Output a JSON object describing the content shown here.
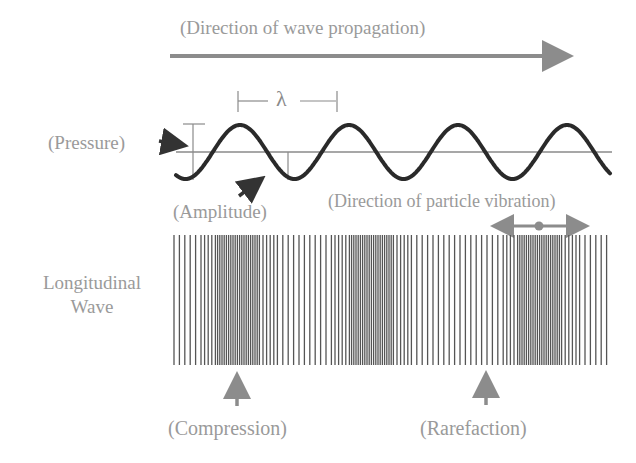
{
  "diagram": {
    "title": "(Direction of wave propagation)",
    "labels": {
      "pressure": "(Pressure)",
      "amplitude": "(Amplitude)",
      "wavelength_symbol": "λ",
      "particle_vibration": "(Direction of particle vibration)",
      "longitudinal_wave": "Longitudinal Wave",
      "compression": "(Compression)",
      "rarefaction": "(Rarefaction)"
    },
    "colors": {
      "text": "#9a9a9a",
      "wave": "#2a2a2a",
      "axis": "#8a8a8a",
      "arrow_gray": "#8c8c8c",
      "bars": "#555555"
    },
    "sine_wave": {
      "cycles": 4,
      "wavelength_px": 109,
      "amplitude_px": 27
    },
    "longitudinal_bars": {
      "compression_centers_x": [
        237,
        370,
        538
      ],
      "rarefaction_centers_x": [
        195,
        300,
        460,
        600
      ]
    }
  }
}
